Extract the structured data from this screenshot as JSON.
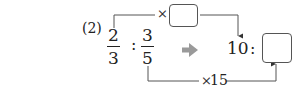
{
  "problem": {
    "label": "(2)",
    "left_ratio": {
      "first": {
        "numerator": "2",
        "denominator": "3"
      },
      "separator": ":",
      "second": {
        "numerator": "3",
        "denominator": "5"
      }
    },
    "arrow_icon": "right-arrow-icon",
    "right_ratio": {
      "first": "10",
      "separator": ":",
      "second_answer_box": ""
    },
    "top_multiplier": {
      "symbol": "×",
      "answer_box": ""
    },
    "bottom_multiplier": {
      "symbol": "×",
      "value": "15"
    },
    "colors": {
      "text": "#222222",
      "arrow": "#9a9a9a",
      "box_border": "#555555"
    }
  }
}
